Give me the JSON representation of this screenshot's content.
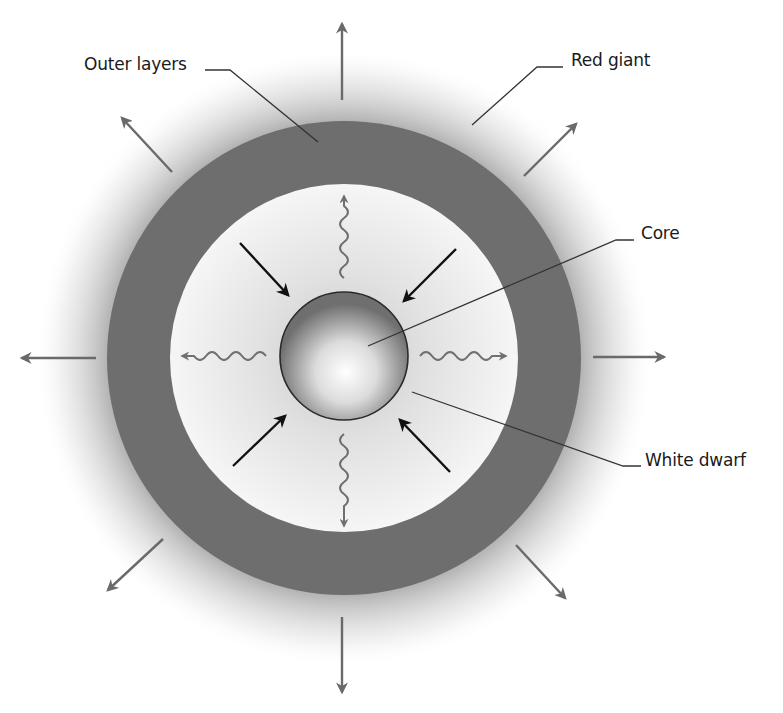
{
  "diagram": {
    "labels": {
      "outer_layers": "Outer layers",
      "red_giant": "Red giant",
      "core": "Core",
      "white_dwarf": "White dwarf"
    },
    "colors": {
      "outer_layer_ring": "#6e6e6e",
      "halo": "#8a8a8a",
      "inner_region": "#f2f2f2",
      "core_edge": "#7a7a7a",
      "inward_arrows": "#111111",
      "outward_arrows": "#6a6a6a",
      "photon_waves": "#707070",
      "leader_lines": "#333333",
      "text": "#1a1a1a"
    },
    "elements": {
      "outward_arrows_count": 8,
      "inward_arrows_count": 4,
      "photon_waves_count": 4
    }
  }
}
